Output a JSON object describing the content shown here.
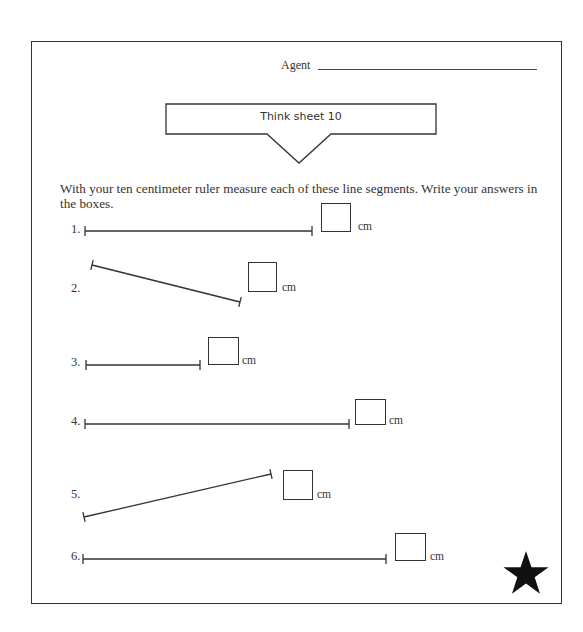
{
  "header": {
    "agent_label": "Agent"
  },
  "title": {
    "text": "Think sheet 10"
  },
  "instructions": {
    "text": "With your ten centimeter ruler measure each of these line segments. Write your answers in the boxes."
  },
  "problems": [
    {
      "number": "1.",
      "unit": "cm",
      "answer": ""
    },
    {
      "number": "2.",
      "unit": "cm",
      "answer": ""
    },
    {
      "number": "3.",
      "unit": "cm",
      "answer": ""
    },
    {
      "number": "4.",
      "unit": "cm",
      "answer": ""
    },
    {
      "number": "5.",
      "unit": "cm",
      "answer": ""
    },
    {
      "number": "6.",
      "unit": "cm",
      "answer": ""
    }
  ],
  "decoration": {
    "star_icon": "star-icon",
    "star_color": "#111111"
  }
}
